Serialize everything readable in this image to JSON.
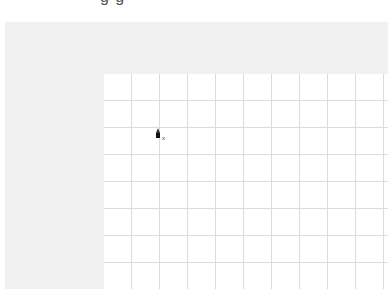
{
  "header": {
    "partial_title_text": "g                              g"
  },
  "canvas": {
    "grid_columns": 10,
    "grid_rows": 8,
    "grid_cell_width_px": 28,
    "grid_cell_height_px": 27,
    "grid_line_color": "#dcdcdc",
    "frame_color": "#f1f1f1"
  },
  "cursor": {
    "icon": "pen-cursor-icon",
    "modifier": "x"
  }
}
